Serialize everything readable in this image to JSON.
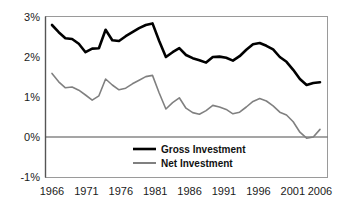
{
  "chart_data": {
    "type": "line",
    "title": "",
    "xlabel": "",
    "ylabel": "",
    "xlim": [
      1966,
      2006
    ],
    "ylim": [
      -1,
      3
    ],
    "grid": false,
    "legend_position": "bottom-center",
    "y_tick_labels": [
      "3%",
      "2%",
      "1%",
      "0%",
      "-1%"
    ],
    "y_tick_values": [
      3,
      2,
      1,
      0,
      -1
    ],
    "x_tick_labels": [
      "1966",
      "1971",
      "1976",
      "1981",
      "1986",
      "1991",
      "1996",
      "2001",
      "2006"
    ],
    "x_tick_values": [
      1966,
      1971,
      1976,
      1981,
      1986,
      1991,
      1996,
      2001,
      2006
    ],
    "x": [
      1966,
      1967,
      1968,
      1969,
      1970,
      1971,
      1972,
      1973,
      1974,
      1975,
      1976,
      1977,
      1978,
      1979,
      1980,
      1981,
      1982,
      1983,
      1984,
      1985,
      1986,
      1987,
      1988,
      1989,
      1990,
      1991,
      1992,
      1993,
      1994,
      1995,
      1996,
      1997,
      1998,
      1999,
      2000,
      2001,
      2002,
      2003,
      2004,
      2005,
      2006
    ],
    "series": [
      {
        "name": "Gross Investment",
        "color": "#000000",
        "width": 2.6,
        "values": [
          2.8,
          2.62,
          2.47,
          2.45,
          2.33,
          2.12,
          2.21,
          2.22,
          2.68,
          2.42,
          2.4,
          2.52,
          2.62,
          2.72,
          2.8,
          2.84,
          2.4,
          2.0,
          2.12,
          2.22,
          2.05,
          1.97,
          1.92,
          1.86,
          2.0,
          2.01,
          1.98,
          1.91,
          2.02,
          2.18,
          2.32,
          2.35,
          2.28,
          2.19,
          2.0,
          1.88,
          1.68,
          1.45,
          1.3,
          1.35,
          1.37
        ]
      },
      {
        "name": "Net Investment",
        "color": "#808080",
        "width": 1.6,
        "values": [
          1.59,
          1.38,
          1.23,
          1.25,
          1.17,
          1.05,
          0.92,
          1.03,
          1.45,
          1.3,
          1.18,
          1.22,
          1.33,
          1.42,
          1.51,
          1.54,
          1.1,
          0.7,
          0.86,
          0.98,
          0.72,
          0.61,
          0.57,
          0.66,
          0.79,
          0.75,
          0.69,
          0.58,
          0.62,
          0.75,
          0.89,
          0.96,
          0.9,
          0.78,
          0.62,
          0.55,
          0.38,
          0.12,
          -0.03,
          0.0,
          0.19
        ]
      }
    ]
  },
  "legend": {
    "items": [
      {
        "label": "Gross Investment",
        "color": "#000000"
      },
      {
        "label": "Net Investment",
        "color": "#808080"
      }
    ]
  },
  "axes": {
    "zero_line_label": "0%",
    "axis_color": "#6b6b6b",
    "zero_line_color": "#4d4d4d"
  }
}
